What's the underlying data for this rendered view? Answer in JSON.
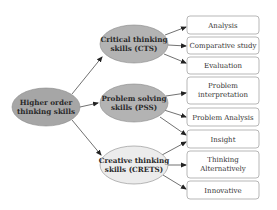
{
  "diagram": {
    "root": {
      "line1": "Higher order",
      "line2": "thinking skills",
      "fill": "#a6a6a6"
    },
    "branches": [
      {
        "line1": "Critical thinking",
        "line2": "skills (CTS)",
        "fill": "#b3b3b3",
        "children": [
          {
            "line1": "Analysis",
            "line2": ""
          },
          {
            "line1": "Comparative study",
            "line2": ""
          },
          {
            "line1": "Evaluation",
            "line2": ""
          }
        ]
      },
      {
        "line1": "Problem solving",
        "line2": "skills (PSS)",
        "fill": "#b3b3b3",
        "children": [
          {
            "line1": "Problem",
            "line2": "interpretation"
          },
          {
            "line1": "Problem Analysis",
            "line2": ""
          },
          {
            "line1": "Insight",
            "line2": ""
          }
        ]
      },
      {
        "line1": "Creative thinking",
        "line2": "skills (CRETS)",
        "fill": "#ececec",
        "children": [
          {
            "line1": "Insight",
            "line2": ""
          },
          {
            "line1": "Thinking",
            "line2": "Alternatively"
          },
          {
            "line1": "Innovative",
            "line2": ""
          }
        ]
      }
    ],
    "colors": {
      "stroke": "#888888",
      "arrow": "#222222",
      "box_stroke": "#9a9a9a"
    }
  }
}
